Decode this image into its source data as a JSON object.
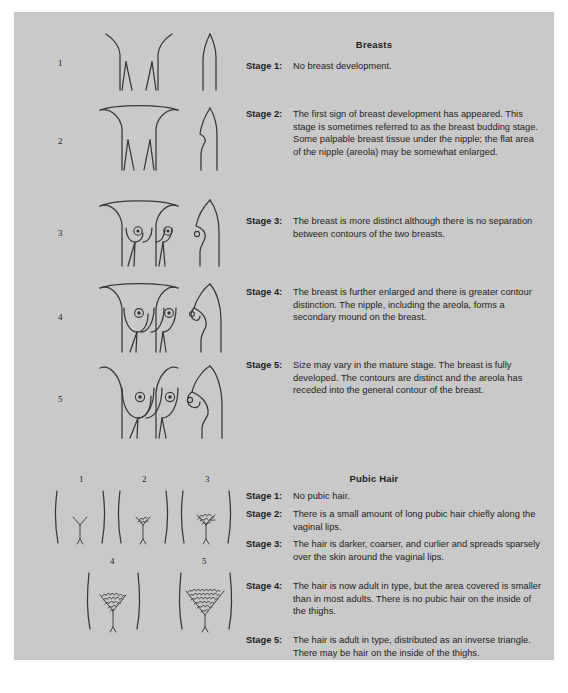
{
  "page": {
    "background_color": "#c9c9c9",
    "text_color": "#252221"
  },
  "breasts": {
    "heading": "Breasts",
    "figure_numbers": [
      "1",
      "2",
      "3",
      "4",
      "5"
    ],
    "stages": [
      {
        "label": "Stage 1:",
        "text": "No breast development."
      },
      {
        "label": "Stage 2:",
        "text": "The first sign of breast development has appeared. This stage is sometimes referred to as the breast budding stage. Some palpable breast tissue under the nipple; the flat area of the nipple (areola) may be somewhat enlarged."
      },
      {
        "label": "Stage 3:",
        "text": "The breast is more distinct although there is no separation between contours of the two breasts."
      },
      {
        "label": "Stage 4:",
        "text": "The breast is further enlarged and there is greater contour distinction. The nipple, including the areola, forms a secondary mound on the breast."
      },
      {
        "label": "Stage 5:",
        "text": "Size may vary in the mature stage. The breast is fully developed. The contours are distinct and the areola has receded into the general contour of the breast."
      }
    ]
  },
  "pubic_hair": {
    "heading": "Pubic Hair",
    "figure_numbers_top": [
      "1",
      "2",
      "3"
    ],
    "figure_numbers_bottom": [
      "4",
      "5"
    ],
    "stages": [
      {
        "label": "Stage 1:",
        "text": "No pubic hair."
      },
      {
        "label": "Stage 2:",
        "text": "There is a small amount of long pubic hair chiefly along the vaginal lips."
      },
      {
        "label": "Stage 3:",
        "text": "The hair is darker, coarser, and curlier and spreads sparsely over the skin around the vaginal lips."
      },
      {
        "label": "Stage 4:",
        "text": "The hair is now adult in type, but the area covered is smaller than in most adults. There is no pubic hair on the inside of the thighs."
      },
      {
        "label": "Stage 5:",
        "text": "The hair is adult in type, distributed as an inverse triangle. There may be hair on the inside of the thighs."
      }
    ]
  }
}
